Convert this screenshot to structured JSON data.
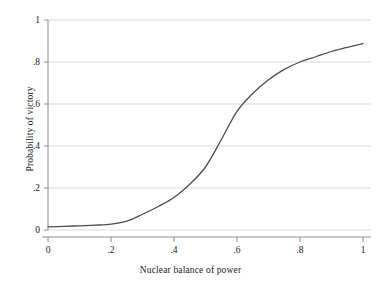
{
  "chart_data": {
    "type": "line",
    "title": "",
    "xlabel": "Nuclear balance of power",
    "ylabel": "Probability of victory",
    "xlim": [
      0,
      1
    ],
    "ylim": [
      0,
      1
    ],
    "xticks": [
      "0",
      ".2",
      ".4",
      ".6",
      ".8",
      "1"
    ],
    "xtick_values": [
      0,
      0.2,
      0.4,
      0.6,
      0.8,
      1
    ],
    "yticks": [
      "0",
      ".2",
      ".4",
      ".6",
      ".8",
      "1"
    ],
    "ytick_values": [
      0,
      0.2,
      0.4,
      0.6,
      0.8,
      1
    ],
    "grid": "horizontal",
    "legend": null,
    "series": [
      {
        "name": "Probability of victory",
        "color": "#4d4d4d",
        "x": [
          0,
          0.05,
          0.1,
          0.15,
          0.2,
          0.25,
          0.3,
          0.35,
          0.4,
          0.45,
          0.5,
          0.55,
          0.6,
          0.65,
          0.7,
          0.75,
          0.8,
          0.85,
          0.9,
          0.95,
          1
        ],
        "values": [
          0.015,
          0.017,
          0.02,
          0.023,
          0.028,
          0.042,
          0.075,
          0.112,
          0.155,
          0.218,
          0.3,
          0.43,
          0.565,
          0.65,
          0.715,
          0.765,
          0.8,
          0.825,
          0.85,
          0.87,
          0.888
        ]
      }
    ]
  },
  "axes": {
    "x_title": "Nuclear balance of power",
    "y_title": "Probability of victory"
  },
  "style": {
    "line_color": "#4d4d4d",
    "grid_color": "#d9d9d9",
    "axis_color": "#8c8c8c",
    "text_color": "#1b1b1b",
    "background": "#ffffff"
  }
}
